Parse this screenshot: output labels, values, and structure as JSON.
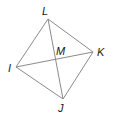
{
  "figure": {
    "type": "quadrilateral-with-diagonals",
    "line_color": "#8a8a8a",
    "label_color": "#1a1a1a",
    "vertices": {
      "L": {
        "label": "L",
        "x": 48,
        "y": 19,
        "lx": 42,
        "ly": 15
      },
      "K": {
        "label": "K",
        "x": 93,
        "y": 52,
        "lx": 97,
        "ly": 56
      },
      "J": {
        "label": "J",
        "x": 63,
        "y": 99,
        "lx": 58,
        "ly": 112
      },
      "I": {
        "label": "I",
        "x": 16,
        "y": 67,
        "lx": 8,
        "ly": 72
      }
    },
    "intersection": {
      "label": "M",
      "x": 56,
      "y": 58,
      "lx": 56,
      "ly": 55
    },
    "edges": [
      [
        "L",
        "K"
      ],
      [
        "K",
        "J"
      ],
      [
        "J",
        "I"
      ],
      [
        "I",
        "L"
      ]
    ],
    "diagonals": [
      [
        "L",
        "J"
      ],
      [
        "I",
        "K"
      ]
    ]
  }
}
